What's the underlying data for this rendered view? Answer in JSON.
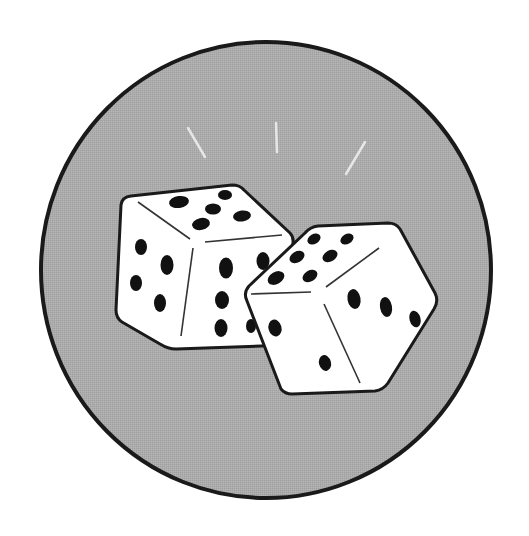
{
  "illustration": {
    "subject": "pair of dice",
    "colors": {
      "background": "#ffffff",
      "badge_fill": "#a9a9a9",
      "outline": "#1a1a1a",
      "die_face": "#ffffff",
      "pip": "#111111",
      "sparkle": "#e6e6e6"
    },
    "dice": [
      {
        "name": "left-die",
        "top_face_pips": 5,
        "left_face_pips": 4,
        "right_face_pips": 6
      },
      {
        "name": "right-die",
        "top_face_pips": 6,
        "left_face_pips": 2,
        "right_face_pips": 3
      }
    ],
    "sparkle_count": 3
  }
}
